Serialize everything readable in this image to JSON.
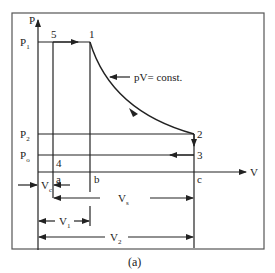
{
  "diagram": {
    "caption": "(a)",
    "axes": {
      "y_label": "P",
      "x_label": "V"
    },
    "pressure_labels": {
      "p1": "P",
      "p1_sub": "1",
      "p2": "P",
      "p2_sub": "2",
      "p0": "P",
      "p0_sub": "o"
    },
    "points": {
      "p1": "1",
      "p2": "2",
      "p3": "3",
      "p4": "4",
      "p5": "5"
    },
    "volume_marks": {
      "a": "a",
      "b": "b",
      "c": "c"
    },
    "curve_annotation": "pV= const.",
    "dimensions": {
      "vc": "V",
      "vc_sub": "c",
      "vs": "V",
      "vs_sub": "s",
      "v1": "V",
      "v1_sub": "1",
      "v2": "V",
      "v2_sub": "2"
    },
    "colors": {
      "line": "#222222",
      "frame": "#555555"
    }
  }
}
